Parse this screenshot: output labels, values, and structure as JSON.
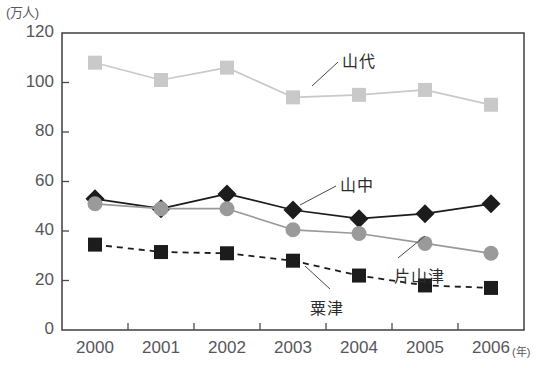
{
  "chart_data": {
    "type": "line",
    "title": "",
    "xlabel": "(年)",
    "ylabel": "(万人)",
    "categories": [
      "2000",
      "2001",
      "2002",
      "2003",
      "2004",
      "2005",
      "2006"
    ],
    "ylim": [
      0,
      120
    ],
    "yticks": [
      "0",
      "20",
      "40",
      "60",
      "80",
      "100",
      "120"
    ],
    "grid": false,
    "legend": "inline-annotations",
    "series": [
      {
        "name": "山代",
        "marker": "square",
        "color": "#c9c9c9",
        "line_style": "solid",
        "values": [
          108,
          101,
          106,
          94,
          95,
          97,
          91
        ]
      },
      {
        "name": "山中",
        "marker": "diamond",
        "color": "#1c1c1c",
        "line_style": "solid",
        "values": [
          53,
          49,
          55,
          48.5,
          45,
          47,
          51
        ]
      },
      {
        "name": "片山津",
        "marker": "circle",
        "color": "#9a9a9a",
        "line_style": "solid",
        "values": [
          51,
          49,
          49,
          40.5,
          39,
          35,
          31
        ]
      },
      {
        "name": "粟津",
        "marker": "square",
        "color": "#1c1c1c",
        "line_style": "dashed",
        "values": [
          34.5,
          31.5,
          31,
          28,
          22,
          18,
          17
        ]
      }
    ]
  },
  "axes": {
    "y_unit": "(万人)",
    "x_unit": "(年)",
    "frame_color": "#4a4a4a"
  },
  "annotations": [
    {
      "text": "山代",
      "x": 342,
      "y": 48
    },
    {
      "text": "山中",
      "x": 340,
      "y": 172
    },
    {
      "text": "片山津",
      "x": 394,
      "y": 263
    },
    {
      "text": "粟津",
      "x": 310,
      "y": 295
    }
  ]
}
